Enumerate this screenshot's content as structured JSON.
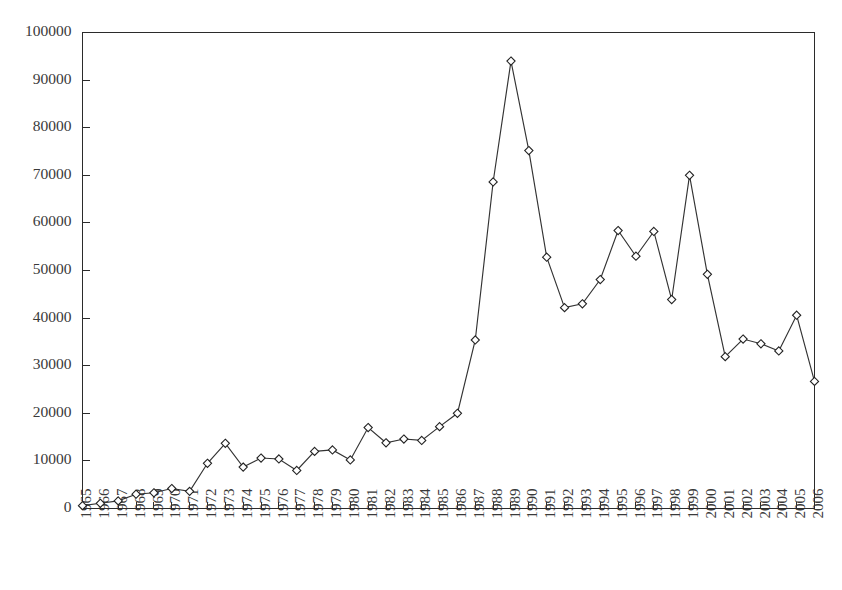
{
  "chart_data": {
    "type": "line",
    "title": "",
    "subtitle": "",
    "xlabel": "",
    "ylabel": "",
    "legend": [],
    "legend_position": "none",
    "grid": false,
    "marker": "diamond",
    "xlim": [
      1965,
      2006
    ],
    "ylim": [
      0,
      100000
    ],
    "ytick_values": [
      0,
      10000,
      20000,
      30000,
      40000,
      50000,
      60000,
      70000,
      80000,
      90000,
      100000
    ],
    "ytick_labels": [
      "0",
      "10000",
      "20000",
      "30000",
      "40000",
      "50000",
      "60000",
      "70000",
      "80000",
      "90000",
      "100000"
    ],
    "xtick_labels": [
      "1965",
      "1966",
      "1967",
      "1968",
      "1969",
      "1970",
      "1971",
      "1972",
      "1973",
      "1974",
      "1975",
      "1976",
      "1977",
      "1978",
      "1979",
      "1980",
      "1981",
      "1982",
      "1983",
      "1984",
      "1985",
      "1986",
      "1987",
      "1988",
      "1989",
      "1990",
      "1991",
      "1992",
      "1993",
      "1994",
      "1995",
      "1996",
      "1997",
      "1998",
      "1999",
      "2000",
      "2001",
      "2002",
      "2003",
      "2004",
      "2005",
      "2006"
    ],
    "xtick_rotation": 90,
    "categories": [
      1965,
      1966,
      1967,
      1968,
      1969,
      1970,
      1971,
      1972,
      1973,
      1974,
      1975,
      1976,
      1977,
      1978,
      1979,
      1980,
      1981,
      1982,
      1983,
      1984,
      1985,
      1986,
      1987,
      1988,
      1989,
      1990,
      1991,
      1992,
      1993,
      1994,
      1995,
      1996,
      1997,
      1998,
      1999,
      2000,
      2001,
      2002,
      2003,
      2004,
      2005,
      2006
    ],
    "values": [
      600,
      1100,
      1600,
      3000,
      3300,
      4200,
      3600,
      9500,
      13700,
      8700,
      10600,
      10400,
      8000,
      12000,
      12300,
      10200,
      17000,
      13800,
      14600,
      14300,
      17200,
      20000,
      35400,
      68600,
      94000,
      75200,
      52800,
      42200,
      43000,
      48100,
      58400,
      53000,
      58200,
      43900,
      70000,
      49200,
      31900,
      35600,
      34600,
      33100,
      40600,
      26700
    ],
    "series": [
      {
        "name": "series-1",
        "values": [
          600,
          1100,
          1600,
          3000,
          3300,
          4200,
          3600,
          9500,
          13700,
          8700,
          10600,
          10400,
          8000,
          12000,
          12300,
          10200,
          17000,
          13800,
          14600,
          14300,
          17200,
          20000,
          35400,
          68600,
          94000,
          75200,
          52800,
          42200,
          43000,
          48100,
          58400,
          53000,
          58200,
          43900,
          70000,
          49200,
          31900,
          35600,
          34600,
          33100,
          40600,
          26700
        ]
      }
    ],
    "colors": {
      "line": "#333333",
      "marker_fill": "#ffffff",
      "marker_stroke": "#222222",
      "axis": "#2b2b2b",
      "background": "#ffffff",
      "tick_text": "#3a3a3a"
    },
    "annotations": []
  }
}
